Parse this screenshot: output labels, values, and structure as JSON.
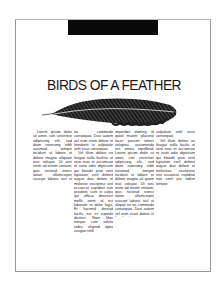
{
  "document": {
    "header_bar_color": "#0a0a0a",
    "title": "BIRDS OF A FEATHER",
    "illustration": "feather-illustration",
    "columns": [
      {
        "paragraphs": [
          "Lorem ipsum dolor sit amet, con secteteur adipiscing elit, sed diam nonnumy nibh euismod tempor incidunt ut labore et dolore magna aliquam erat volupat. Ut wisi enim ad minim veniam, quis nostrud exerci tation ullamcorper suscipit laboris nisl ut aliquip ex"
        ]
      },
      {
        "paragraphs": [
          "ea commodo consequat. Duis autem vel eum iriure dolore in hendrerit in vulputate velit esse consequat.",
          "Vel illum dolore eu feugiat nulla facilisis at vero eros et accumsan et iusto odio dignissim qui blandit prae sent luptatum zzril delenit augue duis dolore et molestie excepteur sint occaecat cupiditat non proident, sunt in culpa qui officia deserunt mollit anim id est laborum et dolor fuga. Et harumd dereud facilis est er expedit distinct. Nam liber tempor cum soluta nobis eligend optio congue nihil"
        ]
      },
      {
        "paragraphs": [
          "imperdiet doming id quod mazim placerat facer possim omnis voluptas assumenda est, omnis repellend. Lorem ipsum dolor sit amet, con sectetuer adipiscing elit, sed diam nonnumy nibh euismod tempor incidunt ut labore et dolore magna ali quam erat volupat. Ut wisi enim ad minim veniam, quis nostrud exerci tation ullamcorper suscipit laboris nisl ut aliquip ex ea commodo consequat. Duis autem vel eum iriure dolore in hendrerit in"
        ]
      },
      {
        "paragraphs": [
          "vulputate velit esse consequat.",
          "Vel illum dolore eu feugiat nulla facilis at vero eros et accumsan et iusto odio dignissim qui blandit prae sent luptatum zzril delenit augue duis dolore et molestias excepteur sint occaecat cupiditat non simil pro vident tempor."
        ]
      }
    ]
  }
}
